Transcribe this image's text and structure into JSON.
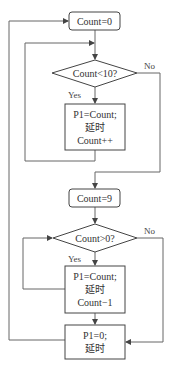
{
  "colors": {
    "stroke": "#555555",
    "text": "#333333",
    "background": "#ffffff"
  },
  "nodes": {
    "start": {
      "label": "Count=0"
    },
    "cond1": {
      "label": "Count<10?"
    },
    "proc1": {
      "line1": "P1=Count;",
      "line2": "延时",
      "line3": "Count++"
    },
    "set9": {
      "label": "Count=9"
    },
    "cond2": {
      "label": "Count>0?"
    },
    "proc2": {
      "line1": "P1=Count;",
      "line2": "延时",
      "line3": "Count−1"
    },
    "proc3": {
      "line1": "P1=0;",
      "line2": "延时"
    }
  },
  "edges": {
    "cond1_yes": "Yes",
    "cond1_no": "No",
    "cond2_yes": "Yes",
    "cond2_no": "No"
  }
}
